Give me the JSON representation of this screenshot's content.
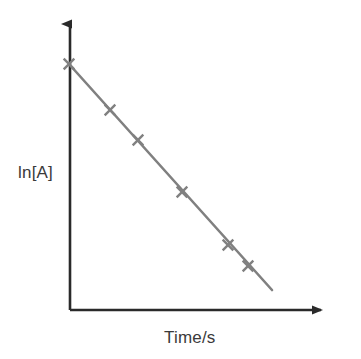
{
  "chart_data": {
    "type": "line",
    "title": "",
    "subtitle": "",
    "xlabel": "Time/s",
    "ylabel": "ln[A]",
    "grid": false,
    "legend": null,
    "annotations": [],
    "axis_style": {
      "arrows": true,
      "ticks": false,
      "tick_labels": false,
      "x_axis_range_labels": [],
      "y_axis_range_labels": []
    },
    "series": [
      {
        "name": "ln[A] vs Time",
        "marker": "x-cross",
        "line": "solid",
        "color": "#808080",
        "points_px": [
          {
            "x": 69,
            "y": 64
          },
          {
            "x": 110,
            "y": 110
          },
          {
            "x": 138,
            "y": 140
          },
          {
            "x": 182,
            "y": 192
          },
          {
            "x": 228,
            "y": 245
          },
          {
            "x": 248,
            "y": 266
          }
        ],
        "x": [
          0,
          1.8,
          3.0,
          4.9,
          6.9,
          7.8
        ],
        "values": [
          10.0,
          8.0,
          6.7,
          4.4,
          2.1,
          1.2
        ]
      }
    ],
    "fit_line_px": {
      "x1": 69,
      "y1": 64,
      "x2": 272,
      "y2": 290
    },
    "xlim": [
      0,
      11.4
    ],
    "ylim": [
      -0.1,
      10.4
    ]
  },
  "colors": {
    "background": "#ffffff",
    "axis": "#2a2a2a",
    "data": "#808080",
    "text": "#3a3a3a"
  },
  "axes": {
    "origin_px": {
      "x": 70,
      "y": 310
    },
    "y_axis_top_px": {
      "x": 70,
      "y": 16
    },
    "x_axis_right_px": {
      "x": 331,
      "y": 310
    }
  }
}
